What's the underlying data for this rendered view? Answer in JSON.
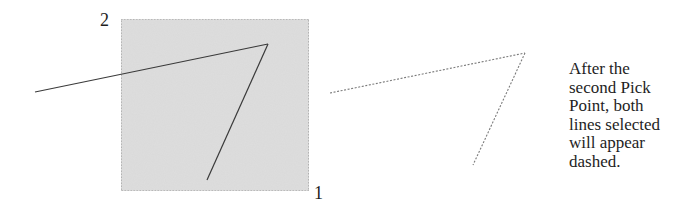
{
  "labels": {
    "pick_point_2": "2",
    "pick_point_1": "1"
  },
  "caption": {
    "lines": [
      "After the",
      "second Pick",
      "Point, both",
      "lines selected",
      "will appear",
      "dashed."
    ]
  },
  "colors": {
    "selection_fill": "#d9d9d9",
    "selection_border": "#8a8a8a",
    "solid_line": "#3a3a3a",
    "dashed_line": "#7a7a7a",
    "text": "#1e1e1e"
  },
  "geometry": {
    "selection_window": {
      "x": 121,
      "y": 19,
      "width": 188,
      "height": 172
    },
    "before_lines": [
      {
        "x1": 35,
        "y1": 92,
        "x2": 268,
        "y2": 44
      },
      {
        "x1": 268,
        "y1": 44,
        "x2": 207,
        "y2": 180
      }
    ],
    "after_lines_dashed": [
      {
        "x1": 330,
        "y1": 93,
        "x2": 525,
        "y2": 53
      },
      {
        "x1": 525,
        "y1": 53,
        "x2": 473,
        "y2": 165
      }
    ]
  }
}
